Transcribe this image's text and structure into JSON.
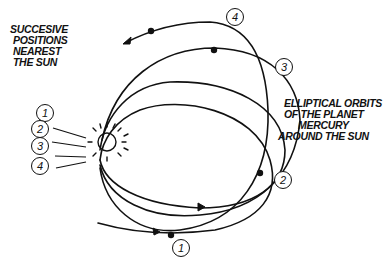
{
  "labels": {
    "positions": [
      "SUCCESIVE",
      "POSITIONS",
      "NEAREST",
      "THE SUN"
    ],
    "orbits": [
      "ELLIPTICAL ORBITS",
      "OF THE PLANET",
      "MERCURY",
      "AROUND THE SUN"
    ]
  },
  "perihelion_markers": [
    "1",
    "2",
    "3",
    "4"
  ],
  "orbit_markers": {
    "orbit1": "1",
    "orbit2": "2",
    "orbit3": "3",
    "orbit4": "4"
  },
  "icons": {
    "sun": "sun-icon",
    "planet": "planet-dot-icon",
    "direction": "arrow-icon"
  },
  "colors": {
    "ink": "#111111",
    "background": "#ffffff"
  }
}
